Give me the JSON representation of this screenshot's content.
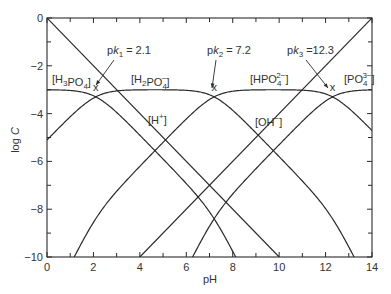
{
  "chart_data": {
    "type": "line",
    "title": "",
    "xlabel": "pH",
    "ylabel": "log C",
    "xlim": [
      0,
      14
    ],
    "ylim": [
      -10,
      0
    ],
    "grid": false,
    "legend": "none (inline species labels)",
    "x_ticks": [
      0,
      2,
      4,
      6,
      8,
      10,
      12,
      14
    ],
    "x_minor_ticks": [
      1,
      3,
      5,
      7,
      9,
      11,
      13
    ],
    "y_ticks": [
      0,
      -2,
      -4,
      -6,
      -8,
      -10
    ],
    "y_minor_ticks": [
      -1,
      -3,
      -5,
      -7,
      -9
    ],
    "total_concentration_log": -3,
    "pKa": [
      2.1,
      7.2,
      12.3
    ],
    "series": [
      {
        "name": "[H3PO4]",
        "key": "h3po4",
        "points_ph": [
          0,
          2.1,
          4,
          6,
          7.2,
          8
        ],
        "points_logc": [
          -3.0,
          -3.3,
          -4.9,
          -6.9,
          -8.4,
          -10.0
        ]
      },
      {
        "name": "[H2PO4-]",
        "key": "h2po4",
        "points_ph": [
          0,
          2.1,
          4,
          6,
          7.2,
          10,
          12.3,
          13.2
        ],
        "points_logc": [
          -5.1,
          -3.3,
          -3.0,
          -3.1,
          -3.3,
          -5.8,
          -8.4,
          -10.0
        ]
      },
      {
        "name": "[HPO4 2-]",
        "key": "hpo4",
        "points_ph": [
          1.2,
          2.1,
          4,
          7.2,
          10,
          12.3,
          14
        ],
        "points_logc": [
          -10.0,
          -8.4,
          -6.2,
          -3.3,
          -3.0,
          -3.3,
          -4.7
        ]
      },
      {
        "name": "[PO4 3-]",
        "key": "po4",
        "points_ph": [
          6.3,
          7.2,
          10,
          12.3,
          14
        ],
        "points_logc": [
          -10.0,
          -8.4,
          -5.3,
          -3.3,
          -3.0
        ]
      },
      {
        "name": "[H+]",
        "key": "h",
        "points_ph": [
          0,
          10
        ],
        "points_logc": [
          0,
          -10
        ]
      },
      {
        "name": "[OH-]",
        "key": "oh",
        "points_ph": [
          4,
          14
        ],
        "points_logc": [
          -10,
          0
        ]
      }
    ],
    "annotations": [
      {
        "text": "pK1 = 2.1",
        "ph": 2.1,
        "logc": -3.3
      },
      {
        "text": "pK2 = 7.2",
        "ph": 7.2,
        "logc": -3.3
      },
      {
        "text": "pK3 = 12.3",
        "ph": 12.3,
        "logc": -3.3
      }
    ]
  },
  "labels": {
    "xlabel": "pH",
    "ylabel": "log C",
    "species": {
      "h3po4": {
        "base": "H",
        "sub1": "3",
        "mid": "PO",
        "sub2": "4",
        "sup": ""
      },
      "h2po4": {
        "base": "H",
        "sub1": "2",
        "mid": "PO",
        "sub2": "4",
        "sup": "−"
      },
      "hpo4": {
        "base": "HPO",
        "sub2": "4",
        "sup": "2−"
      },
      "po4": {
        "base": "PO",
        "sub2": "4",
        "sup": "3−"
      },
      "h": {
        "base": "H",
        "sup": "+"
      },
      "oh": {
        "base": "OH",
        "sup": "−"
      }
    },
    "pk": [
      {
        "prefix": "p",
        "k": "k",
        "sub": "1",
        "value": "= 2.1"
      },
      {
        "prefix": "p",
        "k": "k",
        "sub": "2",
        "value": "= 7.2"
      },
      {
        "prefix": "p",
        "k": "k",
        "sub": "3",
        "value": "=12.3"
      }
    ],
    "marker": "x"
  }
}
